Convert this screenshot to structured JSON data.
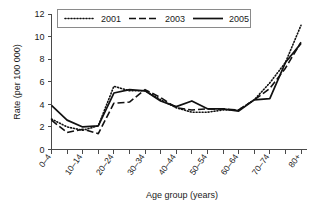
{
  "chart_data": {
    "type": "line",
    "title": "",
    "xlabel": "Age group (years)",
    "ylabel": "Rate (per 100 000)",
    "ylim": [
      0,
      12
    ],
    "yticks": [
      0,
      2,
      4,
      6,
      8,
      10,
      12
    ],
    "grid": false,
    "legend_position": "top",
    "categories": [
      "0–4",
      "5–9",
      "10–14",
      "15–19",
      "20–24",
      "25–29",
      "30–34",
      "35–39",
      "40–44",
      "45–49",
      "50–54",
      "55–59",
      "60–64",
      "65–69",
      "70–74",
      "75–79",
      "80+"
    ],
    "tick_labels_shown": [
      "0–4",
      "10–14",
      "20–24",
      "30–34",
      "40–44",
      "50–54",
      "60–64",
      "70–74",
      "80+"
    ],
    "series": [
      {
        "name": "2001",
        "style": "dotted",
        "values": [
          2.7,
          2.0,
          1.7,
          2.1,
          5.6,
          5.2,
          5.2,
          4.4,
          3.7,
          3.3,
          3.3,
          3.5,
          3.5,
          4.4,
          5.9,
          7.7,
          11.0
        ]
      },
      {
        "name": "2003",
        "style": "dashed",
        "values": [
          2.6,
          1.5,
          1.8,
          1.4,
          4.1,
          4.2,
          5.3,
          4.6,
          3.7,
          3.5,
          3.6,
          3.6,
          3.5,
          4.4,
          5.4,
          7.2,
          9.5
        ]
      },
      {
        "name": "2005",
        "style": "solid",
        "values": [
          3.9,
          2.6,
          2.0,
          2.1,
          5.0,
          5.3,
          5.2,
          4.3,
          3.8,
          4.3,
          3.6,
          3.6,
          3.4,
          4.4,
          4.5,
          7.7,
          9.4
        ]
      }
    ]
  },
  "legend": {
    "items": [
      {
        "label": "2001",
        "style": "dotted"
      },
      {
        "label": "2003",
        "style": "dashed"
      },
      {
        "label": "2005",
        "style": "solid"
      }
    ]
  },
  "axes": {
    "y_title": "Rate (per 100 000)",
    "x_title": "Age group (years)",
    "y_tick_labels": [
      "0",
      "2",
      "4",
      "6",
      "8",
      "10",
      "12"
    ],
    "x_tick_labels": [
      "0–4",
      "10–14",
      "20–24",
      "30–34",
      "40–44",
      "50–54",
      "60–64",
      "70–74",
      "80+"
    ]
  },
  "colors": {
    "line": "#111111",
    "axis": "#4a4a4a",
    "background": "#ffffff",
    "legend_border": "#8a8a8a"
  }
}
